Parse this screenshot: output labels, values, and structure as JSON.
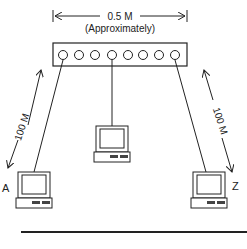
{
  "diagram": {
    "hub_width_label": "0.5 M",
    "hub_width_note": "(Approximately)",
    "left_cable_label": "100 M",
    "right_cable_label": "100 M",
    "node_left_label": "A",
    "node_right_label": "Z",
    "hub_ports": 8,
    "colors": {
      "line": "#222222",
      "background": "#ffffff"
    }
  }
}
